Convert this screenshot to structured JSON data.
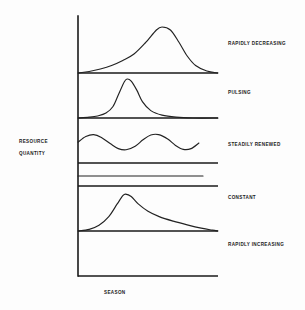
{
  "chart_data": {
    "type": "line",
    "title": "",
    "xlabel": "SEASON",
    "ylabel": "RESOURCE QUANTITY",
    "ylabel_lines": [
      "RESOURCE",
      "QUANTITY"
    ],
    "grid": false,
    "legend": "none",
    "axis_ranges": {
      "x": [
        0,
        1
      ],
      "y": [
        0,
        1
      ]
    },
    "panels": [
      {
        "label": "RAPIDLY DECREASING",
        "shape": "right-skewed bell, slow rise then steep fall",
        "peak_x": 0.6,
        "peak_y": 0.92,
        "x": [
          0.0,
          0.08,
          0.16,
          0.24,
          0.32,
          0.4,
          0.48,
          0.56,
          0.6,
          0.66,
          0.72,
          0.78,
          0.84,
          0.92,
          1.0
        ],
        "y": [
          0.0,
          0.03,
          0.08,
          0.15,
          0.25,
          0.38,
          0.6,
          0.86,
          0.92,
          0.86,
          0.62,
          0.34,
          0.15,
          0.04,
          0.0
        ]
      },
      {
        "label": "PULSING",
        "shape": "narrow symmetric spike",
        "peak_x": 0.35,
        "peak_y": 0.95,
        "x": [
          0.0,
          0.08,
          0.14,
          0.2,
          0.25,
          0.29,
          0.33,
          0.35,
          0.38,
          0.42,
          0.46,
          0.52,
          0.6,
          0.7,
          0.82,
          1.0
        ],
        "y": [
          0.0,
          0.02,
          0.05,
          0.12,
          0.28,
          0.58,
          0.88,
          0.95,
          0.9,
          0.68,
          0.4,
          0.18,
          0.07,
          0.02,
          0.0,
          0.0
        ]
      },
      {
        "label": "STEADILY RENEWED",
        "shape": "sine wave, about 2.5 cycles",
        "cycles": 2.5,
        "amplitude": 0.22,
        "midline": 0.5,
        "x": [
          0.0,
          0.06,
          0.12,
          0.18,
          0.25,
          0.31,
          0.37,
          0.44,
          0.5,
          0.56,
          0.62,
          0.69,
          0.75,
          0.81,
          0.87,
          0.93
        ],
        "y": [
          0.52,
          0.66,
          0.71,
          0.64,
          0.48,
          0.36,
          0.33,
          0.42,
          0.58,
          0.7,
          0.71,
          0.6,
          0.44,
          0.34,
          0.36,
          0.5
        ]
      },
      {
        "label": "CONSTANT",
        "shape": "flat horizontal line at mid height",
        "value": 0.5,
        "x": [
          0.0,
          1.0
        ],
        "y": [
          0.5,
          0.5
        ]
      },
      {
        "label": "RAPIDLY INCREASING",
        "shape": "early peak with long slow decay",
        "peak_x": 0.34,
        "peak_y": 0.9,
        "x": [
          0.0,
          0.08,
          0.15,
          0.22,
          0.28,
          0.32,
          0.34,
          0.38,
          0.43,
          0.5,
          0.58,
          0.68,
          0.78,
          0.88,
          0.96,
          1.0
        ],
        "y": [
          0.0,
          0.04,
          0.14,
          0.35,
          0.66,
          0.86,
          0.9,
          0.84,
          0.66,
          0.48,
          0.35,
          0.24,
          0.15,
          0.07,
          0.02,
          0.0
        ]
      }
    ]
  },
  "labels": {
    "y_axis_line1": "RESOURCE",
    "y_axis_line2": "QUANTITY",
    "x_axis": "SEASON",
    "panel_1": "RAPIDLY DECREASING",
    "panel_2": "PULSING",
    "panel_3": "STEADILY RENEWED",
    "panel_4": "CONSTANT",
    "panel_5": "RAPIDLY INCREASING"
  },
  "colors": {
    "ink": "#1a1a1a",
    "curve": "#222222",
    "background": "#fdfdfd"
  }
}
